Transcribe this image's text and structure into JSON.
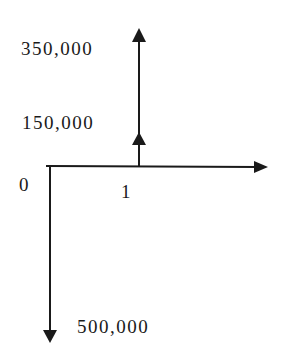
{
  "diagram": {
    "type": "cash-flow-diagram",
    "time_axis": {
      "ticks": [
        "0",
        "1"
      ]
    },
    "cash_flows": [
      {
        "period": "0",
        "direction": "outflow",
        "label": "500,000"
      },
      {
        "period": "1",
        "direction": "inflow",
        "label": "150,000"
      },
      {
        "period": "1",
        "direction": "inflow",
        "label": "350,000"
      }
    ],
    "labels": {
      "inflow_top": "350,000",
      "inflow_mid": "150,000",
      "outflow": "500,000",
      "period_0": "0",
      "period_1": "1"
    },
    "colors": {
      "line": "#1a1a1a",
      "background": "#ffffff"
    }
  }
}
